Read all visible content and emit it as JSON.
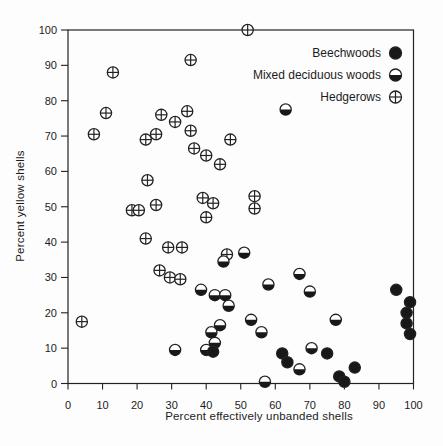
{
  "chart_data": {
    "type": "scatter",
    "xlabel": "Percent effectively unbanded shells",
    "ylabel": "Percent yellow shells",
    "xlim": [
      0,
      100
    ],
    "ylim": [
      0,
      100
    ],
    "xticks": [
      0,
      10,
      20,
      30,
      40,
      50,
      60,
      70,
      80,
      90,
      100
    ],
    "yticks": [
      0,
      10,
      20,
      30,
      40,
      50,
      60,
      70,
      80,
      90,
      100
    ],
    "grid": false,
    "legend_position": "top-right-inside",
    "colors": {
      "marker_stroke": "#222222",
      "marker_fill_dark": "#181818",
      "marker_fill_light": "#ffffff",
      "axis": "#222222",
      "background": "#fdfdfd"
    },
    "series": [
      {
        "name": "Hedgerows",
        "marker": "crossed-circle",
        "points": [
          [
            52,
            100
          ],
          [
            35.5,
            91.5
          ],
          [
            13,
            88
          ],
          [
            11,
            76.5
          ],
          [
            7.5,
            70.5
          ],
          [
            27,
            76
          ],
          [
            31,
            74
          ],
          [
            34.5,
            77
          ],
          [
            35.5,
            71.5
          ],
          [
            22.5,
            69
          ],
          [
            25.5,
            70.5
          ],
          [
            36.5,
            66.5
          ],
          [
            40,
            64.5
          ],
          [
            44,
            62
          ],
          [
            47,
            69
          ],
          [
            23,
            57.5
          ],
          [
            39,
            52.5
          ],
          [
            42,
            51
          ],
          [
            40,
            47
          ],
          [
            54,
            53
          ],
          [
            54,
            49.5
          ],
          [
            18.5,
            49
          ],
          [
            20.5,
            49
          ],
          [
            25.5,
            50.5
          ],
          [
            22.5,
            41
          ],
          [
            29,
            38.5
          ],
          [
            33,
            38.5
          ],
          [
            26.5,
            32
          ],
          [
            29.5,
            30
          ],
          [
            32.5,
            29.5
          ],
          [
            46,
            36.5
          ],
          [
            4,
            17.5
          ]
        ]
      },
      {
        "name": "Mixed deciduous woods",
        "marker": "half-filled-circle",
        "points": [
          [
            63,
            77.5
          ],
          [
            51,
            37
          ],
          [
            45,
            34.5
          ],
          [
            38.5,
            26.5
          ],
          [
            42.5,
            25
          ],
          [
            45.5,
            25
          ],
          [
            46.5,
            22
          ],
          [
            58,
            28
          ],
          [
            67,
            31
          ],
          [
            70,
            26
          ],
          [
            77.5,
            18
          ],
          [
            53,
            18
          ],
          [
            56,
            14.5
          ],
          [
            44,
            16.5
          ],
          [
            41.5,
            14.5
          ],
          [
            42.5,
            11.5
          ],
          [
            40,
            9.5
          ],
          [
            31,
            9.5
          ],
          [
            70.5,
            10
          ],
          [
            67,
            4
          ],
          [
            57,
            0.5
          ]
        ]
      },
      {
        "name": "Beechwoods",
        "marker": "filled-circle",
        "points": [
          [
            95,
            26.5
          ],
          [
            99,
            23
          ],
          [
            98,
            20
          ],
          [
            98,
            17
          ],
          [
            99,
            14
          ],
          [
            75,
            8.5
          ],
          [
            83,
            4.5
          ],
          [
            78.5,
            2
          ],
          [
            80,
            0.5
          ],
          [
            62,
            8.5
          ],
          [
            63.5,
            6
          ],
          [
            42,
            9
          ]
        ]
      }
    ],
    "legend_order": [
      "Beechwoods",
      "Mixed deciduous woods",
      "Hedgerows"
    ]
  }
}
